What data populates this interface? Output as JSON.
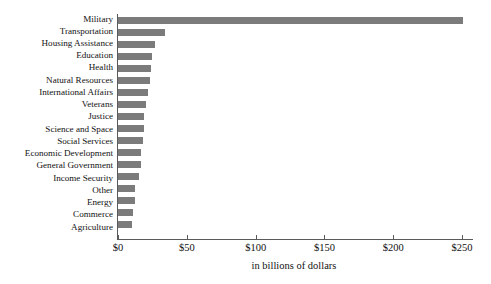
{
  "chart_data": {
    "type": "bar",
    "orientation": "horizontal",
    "title": "",
    "xlabel": "in billions of dollars",
    "ylabel": "",
    "xlim": [
      0,
      255
    ],
    "xticks": [
      0,
      50,
      100,
      150,
      200,
      250
    ],
    "xtick_labels": [
      "$0",
      "$50",
      "$100",
      "$150",
      "$200",
      "$250"
    ],
    "grid": false,
    "legend": null,
    "bar_color": "#7b7b7b",
    "axis_color": "#5a5a5a",
    "categories": [
      "Military",
      "Transportation",
      "Housing Assistance",
      "Education",
      "Health",
      "Natural Resources",
      "International Affairs",
      "Veterans",
      "Justice",
      "Science and Space",
      "Social Services",
      "Economic Development",
      "General Government",
      "Income Security",
      "Other",
      "Energy",
      "Commerce",
      "Agriculture"
    ],
    "values": [
      251,
      34,
      27,
      25,
      24,
      23,
      22,
      20,
      19,
      19,
      18,
      17,
      17,
      15,
      12,
      12,
      11,
      10
    ]
  }
}
